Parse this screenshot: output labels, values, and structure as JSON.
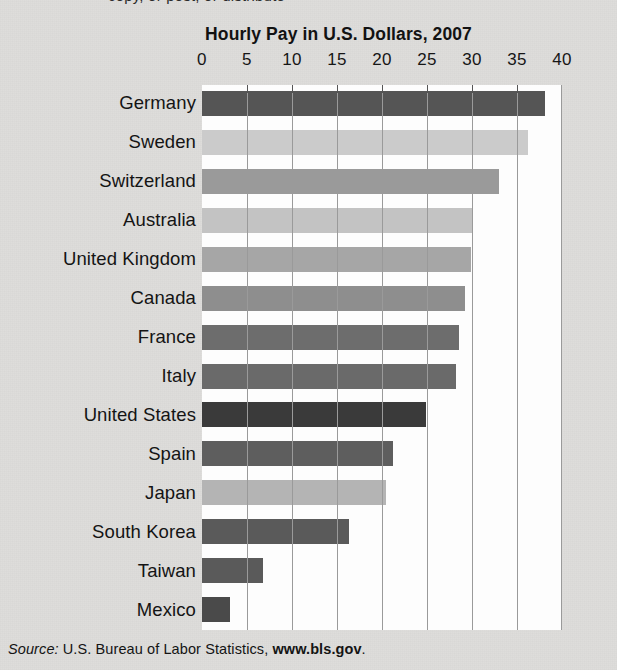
{
  "page": {
    "cut_off_line": "copy, or post, or distribute",
    "source_prefix": "Source:",
    "source_text": " U.S. Bureau of Labor Statistics, ",
    "source_url": "www.bls.gov",
    "source_suffix": "."
  },
  "colors": {
    "background": "#dedddb",
    "plot_background": "#fdfdfd",
    "gridline": "#9a9a9a",
    "text": "#141414"
  },
  "chart_data": {
    "type": "bar",
    "orientation": "horizontal",
    "title": "Hourly Pay in U.S. Dollars, 2007",
    "xlabel": "",
    "ylabel": "",
    "xlim": [
      0,
      40
    ],
    "xticks": [
      0,
      5,
      10,
      15,
      20,
      25,
      30,
      35,
      40
    ],
    "xtick_labels": [
      "0",
      "5",
      "10",
      "15",
      "20",
      "25",
      "30",
      "35",
      "40"
    ],
    "grid": true,
    "legend": "none",
    "categories": [
      "Germany",
      "Sweden",
      "Switzerland",
      "Australia",
      "United Kingdom",
      "Canada",
      "France",
      "Italy",
      "United States",
      "Spain",
      "Japan",
      "South Korea",
      "Taiwan",
      "Mexico"
    ],
    "values": [
      38.1,
      36.2,
      33.0,
      30.1,
      29.9,
      29.2,
      28.5,
      28.2,
      24.9,
      21.2,
      20.4,
      16.3,
      6.8,
      3.1
    ],
    "bar_colors": [
      "#555555",
      "#cbcbcb",
      "#9a9a9a",
      "#c3c3c3",
      "#a6a6a6",
      "#8e8e8e",
      "#6d6d6d",
      "#6a6a6a",
      "#3a3a3a",
      "#5e5e5e",
      "#b4b4b4",
      "#5a5a5a",
      "#5a5a5a",
      "#4a4a4a"
    ]
  }
}
